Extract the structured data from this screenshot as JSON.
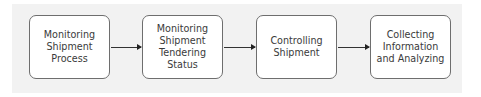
{
  "diagram": {
    "type": "process-flow",
    "direction": "left-to-right",
    "steps": [
      {
        "id": "step-1",
        "label": "Monitoring\nShipment\nProcess"
      },
      {
        "id": "step-2",
        "label": "Monitoring\nShipment\nTendering\nStatus"
      },
      {
        "id": "step-3",
        "label": "Controlling\nShipment"
      },
      {
        "id": "step-4",
        "label": "Collecting\nInformation\nand Analyzing"
      }
    ],
    "connections": [
      {
        "from": "step-1",
        "to": "step-2"
      },
      {
        "from": "step-2",
        "to": "step-3"
      },
      {
        "from": "step-3",
        "to": "step-4"
      }
    ],
    "colors": {
      "panel_background": "#f2f2f2",
      "box_fill": "#ffffff",
      "box_border": "#6e6e6e",
      "text": "#3a3a3a",
      "arrow": "#333333"
    }
  }
}
